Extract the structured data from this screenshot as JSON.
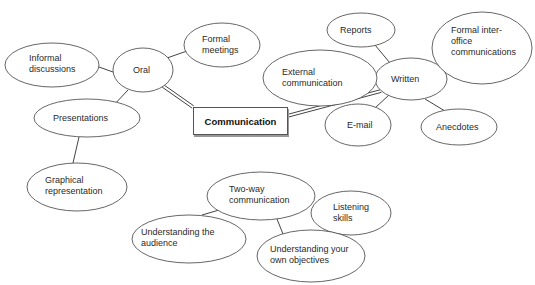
{
  "diagram": {
    "type": "mind-map",
    "central": {
      "label": "Communication"
    },
    "nodes": [
      {
        "id": "oral",
        "label": "Oral",
        "cx": 143,
        "cy": 70,
        "rx": 30,
        "ry": 22,
        "tx": 133,
        "ty": 65
      },
      {
        "id": "informal",
        "label": "Informal\ndiscussions",
        "cx": 52,
        "cy": 65,
        "rx": 47,
        "ry": 22,
        "tx": 29,
        "ty": 53
      },
      {
        "id": "formal-meetings",
        "label": "Formal\nmeetings",
        "cx": 222,
        "cy": 45,
        "rx": 38,
        "ry": 22,
        "tx": 202,
        "ty": 34
      },
      {
        "id": "presentations",
        "label": "Presentations",
        "cx": 87,
        "cy": 118,
        "rx": 53,
        "ry": 19,
        "tx": 53,
        "ty": 113
      },
      {
        "id": "graphical",
        "label": "Graphical\nrepresentation",
        "cx": 77,
        "cy": 187,
        "rx": 50,
        "ry": 24,
        "tx": 45,
        "ty": 175
      },
      {
        "id": "written",
        "label": "Written",
        "cx": 411,
        "cy": 79,
        "rx": 36,
        "ry": 21,
        "tx": 391,
        "ty": 74
      },
      {
        "id": "reports",
        "label": "Reports",
        "cx": 361,
        "cy": 30,
        "rx": 34,
        "ry": 17,
        "tx": 340,
        "ty": 25
      },
      {
        "id": "formal-inter-office",
        "label": "Formal inter-\noffice\ncommunications",
        "cx": 482,
        "cy": 48,
        "rx": 50,
        "ry": 36,
        "tx": 451,
        "ty": 25
      },
      {
        "id": "external",
        "label": "External\ncommunication",
        "cx": 320,
        "cy": 78,
        "rx": 57,
        "ry": 28,
        "tx": 282,
        "ty": 67
      },
      {
        "id": "email",
        "label": "E-mail",
        "cx": 358,
        "cy": 125,
        "rx": 33,
        "ry": 21,
        "tx": 347,
        "ty": 120
      },
      {
        "id": "anecdotes",
        "label": "Anecdotes",
        "cx": 459,
        "cy": 127,
        "rx": 38,
        "ry": 18,
        "tx": 436,
        "ty": 122
      },
      {
        "id": "two-way",
        "label": "Two-way\ncommunication",
        "cx": 261,
        "cy": 196,
        "rx": 54,
        "ry": 24,
        "tx": 229,
        "ty": 184
      },
      {
        "id": "listening",
        "label": "Listening\nskills",
        "cx": 351,
        "cy": 213,
        "rx": 40,
        "ry": 22,
        "tx": 333,
        "ty": 202
      },
      {
        "id": "audience",
        "label": "Understanding the\naudience",
        "cx": 189,
        "cy": 239,
        "rx": 57,
        "ry": 24,
        "tx": 141,
        "ty": 227
      },
      {
        "id": "objectives",
        "label": "Understanding your\nown objectives",
        "cx": 311,
        "cy": 256,
        "rx": 54,
        "ry": 26,
        "tx": 270,
        "ty": 244
      }
    ],
    "edges": [
      {
        "from": "oral",
        "to": "communication",
        "style": "double",
        "x1": 163,
        "y1": 86,
        "x2": 193,
        "y2": 107
      },
      {
        "from": "written",
        "to": "communication",
        "style": "double",
        "x1": 381,
        "y1": 91,
        "x2": 287,
        "y2": 116
      },
      {
        "from": "oral",
        "to": "informal",
        "style": "single",
        "x1": 113,
        "y1": 72,
        "x2": 99,
        "y2": 67
      },
      {
        "from": "oral",
        "to": "formal-meetings",
        "style": "single",
        "x1": 167,
        "y1": 58,
        "x2": 187,
        "y2": 51
      },
      {
        "from": "oral",
        "to": "presentations",
        "style": "single",
        "x1": 128,
        "y1": 90,
        "x2": 112,
        "y2": 107
      },
      {
        "from": "presentations",
        "to": "graphical",
        "style": "single",
        "x1": 79,
        "y1": 137,
        "x2": 73,
        "y2": 163
      },
      {
        "from": "written",
        "to": "reports",
        "style": "single",
        "x1": 390,
        "y1": 63,
        "x2": 375,
        "y2": 45
      },
      {
        "from": "written",
        "to": "formal-inter-office",
        "style": "single",
        "x1": 443,
        "y1": 71,
        "x2": 453,
        "y2": 64
      },
      {
        "from": "written",
        "to": "email",
        "style": "single",
        "x1": 389,
        "y1": 95,
        "x2": 375,
        "y2": 108
      },
      {
        "from": "written",
        "to": "anecdotes",
        "style": "single",
        "x1": 425,
        "y1": 99,
        "x2": 445,
        "y2": 111
      },
      {
        "from": "two-way",
        "to": "listening",
        "style": "single",
        "x1": 315,
        "y1": 207,
        "x2": 333,
        "y2": 207
      },
      {
        "from": "two-way",
        "to": "audience",
        "style": "single",
        "x1": 226,
        "y1": 208,
        "x2": 202,
        "y2": 215
      },
      {
        "from": "two-way",
        "to": "objectives",
        "style": "single",
        "x1": 277,
        "y1": 219,
        "x2": 283,
        "y2": 234
      }
    ]
  }
}
